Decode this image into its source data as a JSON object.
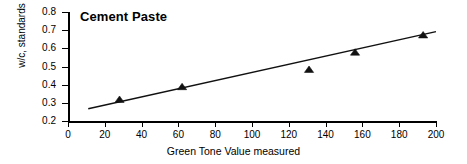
{
  "chart_data": {
    "type": "scatter",
    "title": "Cement Paste",
    "xlabel": "Green Tone Value measured",
    "ylabel": "w/c, standards",
    "xlim": [
      0,
      200
    ],
    "ylim": [
      0.2,
      0.8
    ],
    "xticks": [
      0,
      20,
      40,
      60,
      80,
      100,
      120,
      140,
      160,
      180,
      200
    ],
    "yticks": [
      0.2,
      0.3,
      0.4,
      0.5,
      0.6,
      0.7,
      0.8
    ],
    "xtick_labels": [
      "0",
      "20",
      "40",
      "60",
      "80",
      "100",
      "120",
      "140",
      "160",
      "180",
      "200"
    ],
    "ytick_labels": [
      "0.2",
      "0.3",
      "0.4",
      "0.5",
      "0.6",
      "0.7",
      "0.8"
    ],
    "grid": false,
    "legend": false,
    "marker_style": "triangle",
    "marker_color": "#111111",
    "line_color": "#111111",
    "series": [
      {
        "name": "Cement Paste standards",
        "points": [
          {
            "x": 28,
            "y": 0.32
          },
          {
            "x": 62,
            "y": 0.39
          },
          {
            "x": 131,
            "y": 0.485
          },
          {
            "x": 156,
            "y": 0.58
          },
          {
            "x": 193,
            "y": 0.675
          }
        ]
      }
    ],
    "trendline": {
      "type": "linear",
      "x_start": 11,
      "y_start": 0.268,
      "x_end": 200,
      "y_end": 0.692
    }
  }
}
